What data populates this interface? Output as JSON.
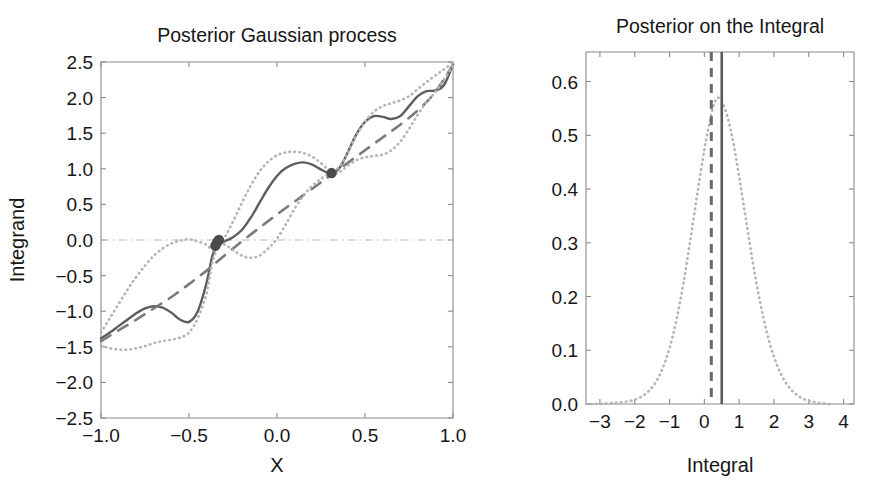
{
  "figure": {
    "width": 882,
    "height": 487,
    "background": "#ffffff",
    "colors": {
      "axis": "#8a8a8a",
      "text": "#161616",
      "mean": "#5d5d5d",
      "prior_mean": "#7a7a7a",
      "confidence_band": "#b4b4b4",
      "data_point": "#4a4a4a",
      "zero_line": "#b9b9b9",
      "vline_solid": "#5a5a5a",
      "vline_dashed": "#6a6a6a"
    }
  },
  "chart_data": [
    {
      "id": "posterior-gaussian-process",
      "type": "line",
      "title": "Posterior Gaussian process",
      "xlabel": "X",
      "ylabel": "Integrand",
      "xlim": [
        -1.0,
        1.0
      ],
      "ylim": [
        -2.5,
        2.5
      ],
      "xticks": [
        -1.0,
        -0.5,
        0.0,
        0.5,
        1.0
      ],
      "xticklabels": [
        "−1.0",
        "−0.5",
        "0.0",
        "0.5",
        "1.0"
      ],
      "yticks": [
        -2.5,
        -2.0,
        -1.5,
        -1.0,
        -0.5,
        0.0,
        0.5,
        1.0,
        1.5,
        2.0,
        2.5
      ],
      "yticklabels": [
        "−2.5",
        "−2.0",
        "−1.5",
        "−1.0",
        "−0.5",
        "0.0",
        "0.5",
        "1.0",
        "1.5",
        "2.0",
        "2.5"
      ],
      "grid": false,
      "legend": "none",
      "zero_line_y": 0.0,
      "series": [
        {
          "name": "posterior mean",
          "style": "solid",
          "x": [
            -1.0,
            -0.95,
            -0.9,
            -0.85,
            -0.8,
            -0.75,
            -0.7,
            -0.65,
            -0.6,
            -0.55,
            -0.5,
            -0.45,
            -0.4,
            -0.37,
            -0.35,
            -0.33,
            -0.3,
            -0.25,
            -0.2,
            -0.15,
            -0.1,
            -0.05,
            0.0,
            0.05,
            0.1,
            0.15,
            0.2,
            0.25,
            0.29,
            0.31,
            0.33,
            0.36,
            0.4,
            0.45,
            0.5,
            0.55,
            0.6,
            0.65,
            0.7,
            0.75,
            0.8,
            0.85,
            0.9,
            0.95,
            1.0
          ],
          "y": [
            -1.38,
            -1.3,
            -1.21,
            -1.12,
            -1.03,
            -0.96,
            -0.93,
            -0.95,
            -1.02,
            -1.12,
            -1.15,
            -1.0,
            -0.6,
            -0.25,
            -0.12,
            -0.05,
            -0.02,
            0.04,
            0.14,
            0.31,
            0.52,
            0.73,
            0.9,
            1.01,
            1.07,
            1.09,
            1.06,
            0.99,
            0.94,
            0.93,
            0.95,
            1.03,
            1.22,
            1.48,
            1.66,
            1.74,
            1.73,
            1.7,
            1.74,
            1.88,
            2.02,
            2.09,
            2.1,
            2.18,
            2.47
          ]
        },
        {
          "name": "prior mean",
          "style": "dashed",
          "x": [
            -1.0,
            -0.9,
            -0.8,
            -0.7,
            -0.6,
            -0.5,
            -0.4,
            -0.3,
            -0.2,
            -0.1,
            0.0,
            0.1,
            0.2,
            0.3,
            0.4,
            0.5,
            0.6,
            0.7,
            0.8,
            0.9,
            1.0
          ],
          "y": [
            -1.42,
            -1.27,
            -1.12,
            -0.96,
            -0.8,
            -0.62,
            -0.43,
            -0.22,
            -0.02,
            0.17,
            0.36,
            0.54,
            0.72,
            0.9,
            1.08,
            1.26,
            1.44,
            1.62,
            1.82,
            2.08,
            2.46
          ]
        },
        {
          "name": "upper confidence band",
          "style": "dotted",
          "x": [
            -1.0,
            -0.95,
            -0.9,
            -0.85,
            -0.8,
            -0.75,
            -0.7,
            -0.65,
            -0.6,
            -0.55,
            -0.5,
            -0.45,
            -0.4,
            -0.37,
            -0.35,
            -0.33,
            -0.3,
            -0.25,
            -0.2,
            -0.15,
            -0.1,
            -0.05,
            0.0,
            0.05,
            0.1,
            0.15,
            0.2,
            0.25,
            0.29,
            0.31,
            0.33,
            0.36,
            0.4,
            0.45,
            0.5,
            0.55,
            0.6,
            0.65,
            0.7,
            0.75,
            0.8,
            0.85,
            0.9,
            0.95,
            1.0
          ],
          "y": [
            -1.3,
            -1.1,
            -0.9,
            -0.7,
            -0.52,
            -0.36,
            -0.22,
            -0.12,
            -0.05,
            -0.01,
            0.01,
            -0.02,
            -0.07,
            -0.14,
            -0.14,
            -0.1,
            0.02,
            0.26,
            0.52,
            0.76,
            0.96,
            1.1,
            1.19,
            1.23,
            1.24,
            1.22,
            1.17,
            1.08,
            0.99,
            0.96,
            0.98,
            1.05,
            1.22,
            1.46,
            1.66,
            1.8,
            1.88,
            1.92,
            1.96,
            2.02,
            2.12,
            2.22,
            2.31,
            2.4,
            2.49
          ]
        },
        {
          "name": "lower confidence band",
          "style": "dotted",
          "x": [
            -1.0,
            -0.95,
            -0.9,
            -0.85,
            -0.8,
            -0.75,
            -0.7,
            -0.65,
            -0.6,
            -0.55,
            -0.5,
            -0.45,
            -0.4,
            -0.37,
            -0.35,
            -0.33,
            -0.3,
            -0.25,
            -0.2,
            -0.15,
            -0.1,
            -0.05,
            0.0,
            0.05,
            0.1,
            0.15,
            0.2,
            0.25,
            0.29,
            0.31,
            0.33,
            0.36,
            0.4,
            0.45,
            0.5,
            0.55,
            0.6,
            0.65,
            0.7,
            0.75,
            0.8,
            0.85,
            0.9,
            0.95,
            1.0
          ],
          "y": [
            -1.48,
            -1.52,
            -1.54,
            -1.54,
            -1.52,
            -1.49,
            -1.45,
            -1.42,
            -1.4,
            -1.37,
            -1.3,
            -1.1,
            -0.75,
            -0.35,
            -0.18,
            -0.08,
            -0.06,
            -0.14,
            -0.22,
            -0.25,
            -0.22,
            -0.12,
            0.02,
            0.22,
            0.44,
            0.62,
            0.76,
            0.86,
            0.92,
            0.92,
            0.93,
            0.96,
            1.04,
            1.12,
            1.16,
            1.18,
            1.2,
            1.26,
            1.38,
            1.56,
            1.76,
            1.94,
            2.08,
            2.26,
            2.45
          ]
        }
      ],
      "data_points": {
        "name": "observations",
        "x": [
          -0.35,
          -0.34,
          -0.33,
          0.31
        ],
        "y": [
          -0.08,
          -0.03,
          0.0,
          0.94
        ]
      }
    },
    {
      "id": "posterior-on-the-integral",
      "type": "line",
      "title": "Posterior on the Integral",
      "xlabel": "Integral",
      "ylabel": "",
      "xlim": [
        -3.4,
        4.3
      ],
      "ylim": [
        0.0,
        0.655
      ],
      "xticks": [
        -3,
        -2,
        -1,
        0,
        1,
        2,
        3,
        4
      ],
      "xticklabels": [
        "−3",
        "−2",
        "−1",
        "0",
        "1",
        "2",
        "3",
        "4"
      ],
      "yticks": [
        0.0,
        0.1,
        0.2,
        0.3,
        0.4,
        0.5,
        0.6
      ],
      "yticklabels": [
        "0.0",
        "0.1",
        "0.2",
        "0.3",
        "0.4",
        "0.5",
        "0.6"
      ],
      "grid": false,
      "legend": "none",
      "series": [
        {
          "name": "posterior density",
          "style": "dotted",
          "mean": 0.25,
          "sigma": 0.7,
          "peak": 0.57,
          "x": [
            -3.4,
            -3.2,
            -3.0,
            -2.8,
            -2.6,
            -2.4,
            -2.2,
            -2.0,
            -1.8,
            -1.6,
            -1.4,
            -1.2,
            -1.0,
            -0.8,
            -0.6,
            -0.4,
            -0.2,
            0.0,
            0.1,
            0.25,
            0.4,
            0.6,
            0.8,
            1.0,
            1.2,
            1.4,
            1.6,
            1.8,
            2.0,
            2.2,
            2.4,
            2.6,
            2.8,
            3.0,
            3.2,
            3.4,
            3.6
          ],
          "y": [
            0.0,
            0.0,
            0.0,
            0.001,
            0.002,
            0.003,
            0.005,
            0.008,
            0.014,
            0.024,
            0.04,
            0.066,
            0.104,
            0.157,
            0.225,
            0.306,
            0.392,
            0.473,
            0.508,
            0.552,
            0.57,
            0.548,
            0.497,
            0.423,
            0.341,
            0.261,
            0.19,
            0.132,
            0.088,
            0.056,
            0.034,
            0.02,
            0.011,
            0.006,
            0.003,
            0.001,
            0.0
          ]
        }
      ],
      "vlines": [
        {
          "name": "posterior mean estimate",
          "style": "solid",
          "x": 0.5
        },
        {
          "name": "true integral value",
          "style": "dashed",
          "x": 0.2
        }
      ]
    }
  ]
}
